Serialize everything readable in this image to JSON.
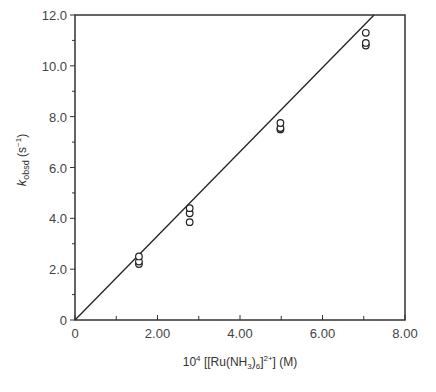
{
  "chart_data": {
    "type": "scatter",
    "title": "",
    "xlabel": "10^4 [[Ru(NH3)6]2+] (M)",
    "ylabel": "k_obsd (s^-1)",
    "xlim": [
      0,
      8.0
    ],
    "ylim": [
      0,
      12.0
    ],
    "x_ticks": [
      "0",
      "2.00",
      "4.00",
      "6.00",
      "8.00"
    ],
    "y_ticks": [
      "0",
      "2.0",
      "4.0",
      "6.0",
      "8.0",
      "10.0",
      "12.0"
    ],
    "grid": false,
    "legend": null,
    "series": [
      {
        "name": "k_obsd data",
        "marker": "open-circle",
        "x": [
          1.55,
          1.55,
          1.55,
          2.78,
          2.78,
          2.78,
          4.98,
          4.98,
          4.98,
          7.05,
          7.05,
          7.05
        ],
        "y": [
          2.2,
          2.3,
          2.5,
          3.85,
          4.2,
          4.4,
          7.5,
          7.55,
          7.75,
          10.8,
          10.9,
          11.3
        ]
      },
      {
        "name": "linear fit",
        "type": "line",
        "x": [
          0,
          7.25
        ],
        "y": [
          0,
          12.0
        ]
      }
    ]
  },
  "labels": {
    "y_axis_k": "k",
    "y_axis_sub": "obsd",
    "y_axis_unit_open": " (s",
    "y_axis_unit_sup": "−1",
    "y_axis_unit_close": ")",
    "x_axis_prefix": "10",
    "x_axis_prefix_sup": "4",
    "x_axis_main": " [[Ru(NH",
    "x_axis_sub3": "3",
    "x_axis_mid": ")",
    "x_axis_sub6": "6",
    "x_axis_bracket": "]",
    "x_axis_sup": "2+",
    "x_axis_tail": "] (M)"
  }
}
